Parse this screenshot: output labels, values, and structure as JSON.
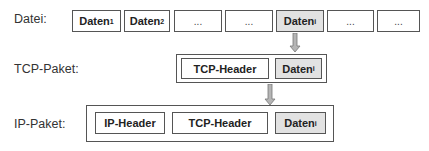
{
  "rows": {
    "datei": {
      "label": "Datei:",
      "cells": [
        {
          "text": "Daten",
          "sub": "1",
          "highlight": false
        },
        {
          "text": "Daten",
          "sub": "2",
          "highlight": false
        },
        {
          "text": "...",
          "sub": "",
          "highlight": false
        },
        {
          "text": "...",
          "sub": "",
          "highlight": false
        },
        {
          "text": "Daten",
          "sub": "i",
          "highlight": true
        },
        {
          "text": "...",
          "sub": "",
          "highlight": false
        },
        {
          "text": "...",
          "sub": "",
          "highlight": false
        }
      ]
    },
    "tcp": {
      "label": "TCP-Paket:",
      "header": "TCP-Header",
      "data": {
        "text": "Daten",
        "sub": "i"
      }
    },
    "ip": {
      "label": "IP-Paket:",
      "ip_header": "IP-Header",
      "tcp_header": "TCP-Header",
      "data": {
        "text": "Daten",
        "sub": "i"
      }
    }
  },
  "colors": {
    "border": "#555555",
    "highlight_fill": "#e2e2e2",
    "arrow_fill": "#b5b5b5",
    "arrow_stroke": "#777777"
  }
}
